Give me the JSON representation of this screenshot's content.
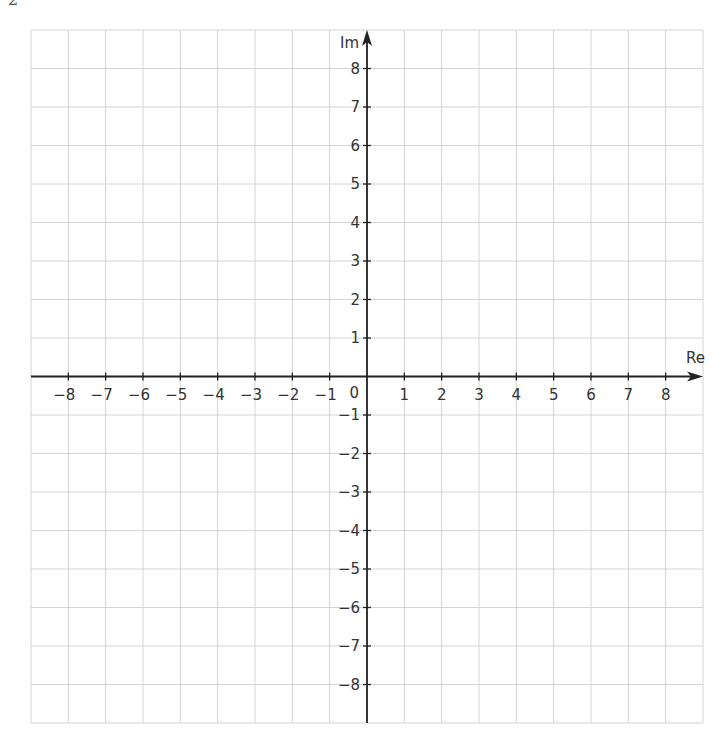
{
  "page": {
    "number": "2"
  },
  "chart_data": {
    "type": "scatter",
    "title": "",
    "xlabel": "Re",
    "ylabel": "Im",
    "xlim": [
      -9,
      9
    ],
    "ylim": [
      -9,
      9
    ],
    "grid": true,
    "x_ticks": [
      -8,
      -7,
      -6,
      -5,
      -4,
      -3,
      -2,
      -1,
      1,
      2,
      3,
      4,
      5,
      6,
      7,
      8
    ],
    "y_ticks": [
      -8,
      -7,
      -6,
      -5,
      -4,
      -3,
      -2,
      -1,
      1,
      2,
      3,
      4,
      5,
      6,
      7,
      8
    ],
    "x_tick_labels": [
      "−8",
      "−7",
      "−6",
      "−5",
      "−4",
      "−3",
      "−2",
      "−1",
      "1",
      "2",
      "3",
      "4",
      "5",
      "6",
      "7",
      "8"
    ],
    "y_tick_labels": [
      "−8",
      "−7",
      "−6",
      "−5",
      "−4",
      "−3",
      "−2",
      "−1",
      "1",
      "2",
      "3",
      "4",
      "5",
      "6",
      "7",
      "8"
    ],
    "origin_label": "0",
    "series": [],
    "legend": null
  },
  "colors": {
    "grid": "#d4d4d4",
    "axis": "#222222",
    "text": "#333333"
  }
}
